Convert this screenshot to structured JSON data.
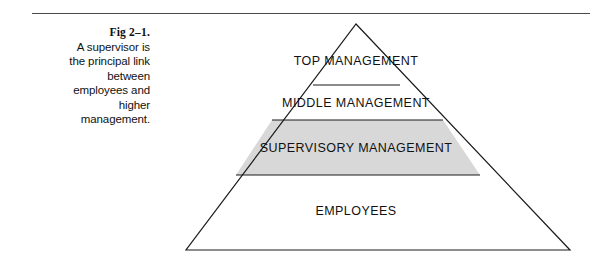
{
  "figure": {
    "caption": {
      "figure_number": "Fig 2–1.",
      "lines": [
        "A supervisor is",
        "the principal link",
        "between",
        "employees and",
        "higher",
        "management."
      ]
    },
    "diagram": {
      "type": "pyramid",
      "description": "Organizational hierarchy pyramid with four tiers",
      "tiers": [
        {
          "label": "TOP MANAGEMENT",
          "fill": "#ffffff"
        },
        {
          "label": "MIDDLE MANAGEMENT",
          "fill": "#ffffff"
        },
        {
          "label": "SUPERVISORY MANAGEMENT",
          "fill": "#d8d8d8"
        },
        {
          "label": "EMPLOYEES",
          "fill": "#ffffff"
        }
      ],
      "colors": {
        "outline": "#1a1a1a",
        "highlight_fill": "#d8d8d8",
        "background": "#ffffff",
        "rule": "#4a4a4a"
      }
    }
  }
}
